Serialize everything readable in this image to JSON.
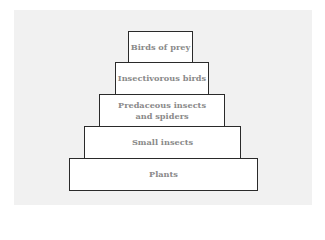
{
  "diagram": {
    "type": "food-pyramid",
    "tiers": [
      {
        "label": "Birds of prey",
        "level": 5
      },
      {
        "label": "Insectivorous birds",
        "level": 4
      },
      {
        "label": "Predaceous insects and spiders",
        "level": 3
      },
      {
        "label": "Small insects",
        "level": 2
      },
      {
        "label": "Plants",
        "level": 1
      }
    ]
  }
}
